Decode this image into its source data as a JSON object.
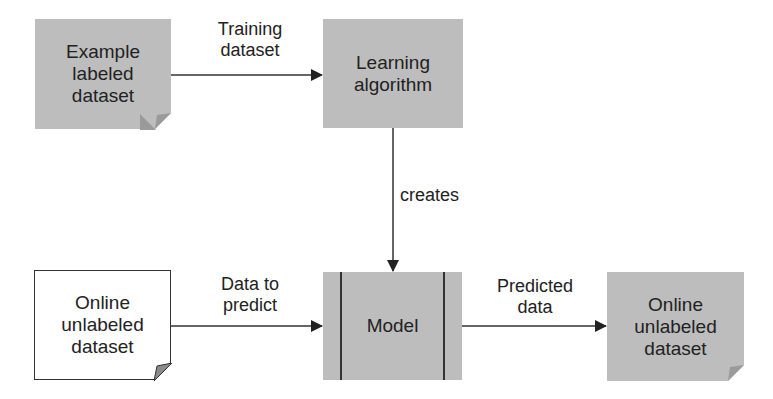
{
  "diagram": {
    "nodes": {
      "example_labeled": {
        "label": "Example\nlabeled\ndataset",
        "lines": [
          "Example",
          "labeled",
          "dataset"
        ],
        "shape": "document",
        "fill": "#bdbdbd"
      },
      "learning_algorithm": {
        "label": "Learning\nalgorithm",
        "lines": [
          "Learning",
          "algorithm"
        ],
        "shape": "rectangle",
        "fill": "#bdbdbd"
      },
      "model": {
        "label": "Model",
        "shape": "predefined-process",
        "fill": "#bdbdbd"
      },
      "online_unlabeled_in": {
        "label": "Online\nunlabeled\ndataset",
        "lines": [
          "Online",
          "unlabeled",
          "dataset"
        ],
        "shape": "document",
        "fill": "#ffffff"
      },
      "online_unlabeled_out": {
        "label": "Online\nunlabeled\ndataset",
        "lines": [
          "Online",
          "unlabeled",
          "dataset"
        ],
        "shape": "document",
        "fill": "#bdbdbd"
      }
    },
    "edges": [
      {
        "from": "example_labeled",
        "to": "learning_algorithm",
        "lines": [
          "Training",
          "dataset"
        ]
      },
      {
        "from": "learning_algorithm",
        "to": "model",
        "lines": [
          "creates"
        ]
      },
      {
        "from": "online_unlabeled_in",
        "to": "model",
        "lines": [
          "Data to",
          "predict"
        ]
      },
      {
        "from": "model",
        "to": "online_unlabeled_out",
        "lines": [
          "Predicted",
          "data"
        ]
      }
    ]
  }
}
